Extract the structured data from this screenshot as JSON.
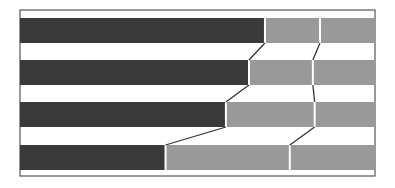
{
  "chart_data": {
    "type": "bar",
    "orientation": "horizontal",
    "stacked": true,
    "normalized": true,
    "title": "",
    "xlabel": "",
    "ylabel": "",
    "categories": [
      "Row 1",
      "Row 2",
      "Row 3",
      "Row 4"
    ],
    "series": [
      {
        "name": "Segment 1",
        "color": "#3a3a3a",
        "values": [
          69,
          64.5,
          58,
          41
        ]
      },
      {
        "name": "Segment 2",
        "color": "#999999",
        "values": [
          15.5,
          18,
          25,
          35
        ]
      },
      {
        "name": "Segment 3",
        "color": "#999999",
        "values": [
          15.5,
          17.5,
          17,
          24
        ]
      }
    ],
    "xlim": [
      0,
      100
    ],
    "grid": false,
    "legend": "none",
    "connector_lines": true
  },
  "layout": {
    "plot_left": 20,
    "plot_right": 375,
    "plot_top": 10,
    "plot_bottom": 176,
    "bar_tops": [
      18,
      60,
      102,
      145
    ],
    "bar_height": 25
  }
}
